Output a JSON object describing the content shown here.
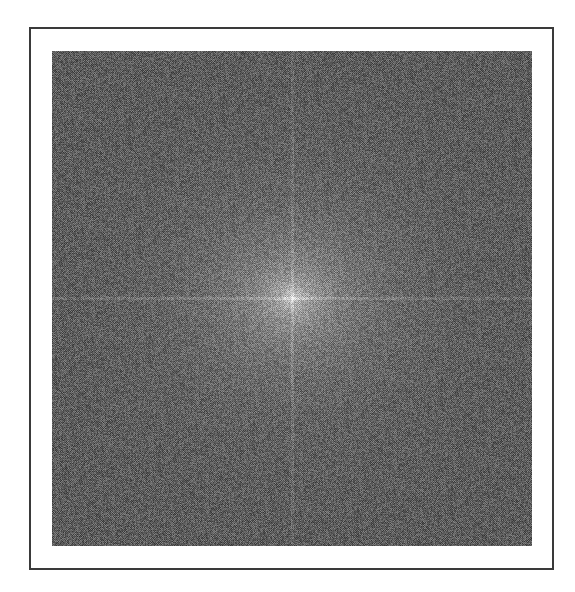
{
  "figure": {
    "kind": "2D Fourier magnitude spectrum (centered, log-scaled)",
    "frame_color": "#3a3a3a",
    "background_mean_gray": "#676767",
    "center_peak_color": "#e6e6e6",
    "center_px": [
      292,
      298
    ],
    "axis_lines": {
      "horizontal_y": 298,
      "vertical_x": 292
    }
  }
}
